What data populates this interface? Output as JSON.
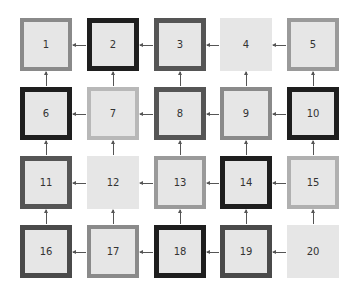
{
  "diagram": {
    "type": "grid-flow",
    "rows": 4,
    "cols": 5,
    "fill_color": "#e6e6e6",
    "arrow_direction": {
      "horizontal": "left",
      "vertical": "up"
    },
    "cells": [
      {
        "label": "1",
        "border": "#8a8a8a",
        "width": 4
      },
      {
        "label": "2",
        "border": "#1e1e1e",
        "width": 5
      },
      {
        "label": "3",
        "border": "#555555",
        "width": 5
      },
      {
        "label": "4",
        "border": "none",
        "width": 0
      },
      {
        "label": "5",
        "border": "#9a9a9a",
        "width": 4
      },
      {
        "label": "6",
        "border": "#1e1e1e",
        "width": 5
      },
      {
        "label": "7",
        "border": "#b8b8b8",
        "width": 4
      },
      {
        "label": "8",
        "border": "#555555",
        "width": 5
      },
      {
        "label": "9",
        "border": "#8a8a8a",
        "width": 4
      },
      {
        "label": "10",
        "border": "#1e1e1e",
        "width": 5
      },
      {
        "label": "11",
        "border": "#555555",
        "width": 5
      },
      {
        "label": "12",
        "border": "none",
        "width": 0
      },
      {
        "label": "13",
        "border": "#9a9a9a",
        "width": 4
      },
      {
        "label": "14",
        "border": "#1e1e1e",
        "width": 5
      },
      {
        "label": "15",
        "border": "#b0b0b0",
        "width": 4
      },
      {
        "label": "16",
        "border": "#4a4a4a",
        "width": 5
      },
      {
        "label": "17",
        "border": "#8a8a8a",
        "width": 4
      },
      {
        "label": "18",
        "border": "#1e1e1e",
        "width": 5
      },
      {
        "label": "19",
        "border": "#4a4a4a",
        "width": 5
      },
      {
        "label": "20",
        "border": "none",
        "width": 0
      }
    ]
  }
}
